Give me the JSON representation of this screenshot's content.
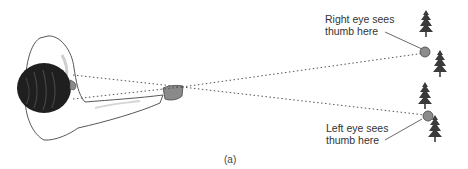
{
  "figure": {
    "caption": "(a)",
    "labels": {
      "right_eye_line1": "Right eye sees",
      "right_eye_line2": "thumb here",
      "left_eye_line1": "Left eye sees",
      "left_eye_line2": "thumb here"
    },
    "colors": {
      "hair": "#1f1f1f",
      "hand": "#8a8a8a",
      "thumb_dot": "#8c8c8c",
      "tree": "#3a3a3a",
      "outline": "#444444",
      "text": "#333333"
    }
  }
}
